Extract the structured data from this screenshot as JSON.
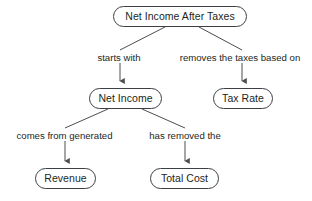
{
  "diagram": {
    "type": "concept-map",
    "style": {
      "node_fill": "#ffffff",
      "node_stroke": "#3c3f44",
      "edge_stroke": "#4a4d52",
      "text_color": "#1d1f21",
      "background": "#ffffff",
      "node_shape": "rounded-pill"
    },
    "nodes": [
      {
        "id": "net-income-after-taxes",
        "label": "Net Income After Taxes",
        "x": 113,
        "y": 6,
        "w": 134,
        "h": 21
      },
      {
        "id": "net-income",
        "label": "Net Income",
        "x": 89,
        "y": 88,
        "w": 73,
        "h": 21
      },
      {
        "id": "tax-rate",
        "label": "Tax Rate",
        "x": 213,
        "y": 88,
        "w": 60,
        "h": 21
      },
      {
        "id": "revenue",
        "label": "Revenue",
        "x": 35,
        "y": 168,
        "w": 61,
        "h": 21
      },
      {
        "id": "total-cost",
        "label": "Total Cost",
        "x": 150,
        "y": 168,
        "w": 69,
        "h": 21
      }
    ],
    "edges": [
      {
        "id": "edge-starts-with",
        "from": "net-income-after-taxes",
        "to": "net-income",
        "label": "starts with",
        "label_x": 89,
        "label_y": 53,
        "label_w": 60,
        "diagonal": {
          "x1": 165,
          "y1": 27,
          "x2": 120,
          "y2": 50
        },
        "arrow": {
          "x": 120,
          "y_start": 63,
          "y_end": 87
        }
      },
      {
        "id": "edge-removes-the-taxes-based-on",
        "from": "net-income-after-taxes",
        "to": "tax-rate",
        "label": "removes the taxes based on",
        "label_x": 167,
        "label_y": 53,
        "label_w": 146,
        "diagonal": {
          "x1": 199,
          "y1": 27,
          "x2": 242,
          "y2": 50
        },
        "arrow": {
          "x": 242,
          "y_start": 63,
          "y_end": 87
        }
      },
      {
        "id": "edge-comes-from-generated",
        "from": "net-income",
        "to": "revenue",
        "label": "comes from generated",
        "label_x": 6,
        "label_y": 131,
        "label_w": 117,
        "diagonal": {
          "x1": 108,
          "y1": 109,
          "x2": 65,
          "y2": 128
        },
        "arrow": {
          "x": 65,
          "y_start": 141,
          "y_end": 167
        }
      },
      {
        "id": "edge-has-removed-the",
        "from": "net-income",
        "to": "total-cost",
        "label": "has removed the",
        "label_x": 141,
        "label_y": 131,
        "label_w": 88,
        "diagonal": {
          "x1": 142,
          "y1": 109,
          "x2": 185,
          "y2": 128
        },
        "arrow": {
          "x": 185,
          "y_start": 141,
          "y_end": 167
        }
      }
    ]
  }
}
